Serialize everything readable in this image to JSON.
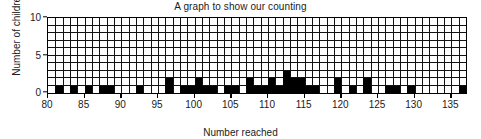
{
  "chart_data": {
    "type": "bar",
    "title": "A graph to show our counting",
    "xlabel": "Number reached",
    "ylabel": "Number of children",
    "xlim": [
      80,
      137
    ],
    "ylim": [
      0,
      10
    ],
    "grid": true,
    "grid_step_x": 1,
    "grid_step_y": 1,
    "legend": null,
    "bar_color": "#000000",
    "xtick_labels": [
      "80",
      "85",
      "90",
      "95",
      "100",
      "105",
      "110",
      "115",
      "120",
      "125",
      "130",
      "135"
    ],
    "xtick_values": [
      80,
      85,
      90,
      95,
      100,
      105,
      110,
      115,
      120,
      125,
      130,
      135
    ],
    "ytick_labels": [
      "0",
      "5",
      "10"
    ],
    "ytick_values": [
      0,
      5,
      10
    ],
    "categories": [
      80,
      81,
      82,
      83,
      84,
      85,
      86,
      87,
      88,
      89,
      90,
      91,
      92,
      93,
      94,
      95,
      96,
      97,
      98,
      99,
      100,
      101,
      102,
      103,
      104,
      105,
      106,
      107,
      108,
      109,
      110,
      111,
      112,
      113,
      114,
      115,
      116,
      117,
      118,
      119,
      120,
      121,
      122,
      123,
      124,
      125,
      126,
      127,
      128,
      129,
      130,
      131,
      132,
      133,
      134,
      135,
      136
    ],
    "values": [
      0,
      1,
      0,
      1,
      0,
      1,
      0,
      1,
      1,
      0,
      0,
      0,
      1,
      0,
      0,
      0,
      2,
      0,
      1,
      1,
      2,
      1,
      1,
      0,
      1,
      1,
      0,
      2,
      1,
      1,
      2,
      1,
      3,
      2,
      2,
      1,
      1,
      0,
      0,
      2,
      0,
      1,
      0,
      2,
      0,
      0,
      1,
      1,
      0,
      1,
      0,
      0,
      0,
      0,
      0,
      0,
      1
    ]
  },
  "labels": {
    "title": "A graph to show our counting",
    "xlabel": "Number reached",
    "ylabel": "Number of children"
  }
}
